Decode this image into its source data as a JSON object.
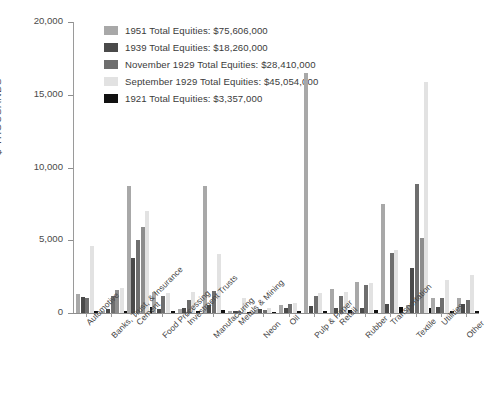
{
  "chart_data": {
    "type": "bar",
    "title": "",
    "xlabel": "",
    "ylabel": "$ THOUSANDS",
    "ylim": [
      0,
      20000
    ],
    "ytick_labels": [
      "0",
      "5,000",
      "10,000",
      "15,000",
      "20,000"
    ],
    "ytick_values": [
      0,
      5000,
      10000,
      15000,
      20000
    ],
    "grid": false,
    "legend_position": "top-left",
    "categories": [
      "Automotive",
      "Banks, Trust, & Insurance",
      "Cement",
      "Food Processing",
      "Investment Trusts",
      "Manufacturing",
      "Metals & Mining",
      "Neon",
      "Oil",
      "Pulp & Paper",
      "Retail",
      "Rubber",
      "Transportation",
      "Textile",
      "Utilities",
      "Other"
    ],
    "series": [
      {
        "name": "1951 Total Equities: $75,606,000",
        "short_name": "1951",
        "color": "#a8a8a8",
        "values": [
          1300,
          140,
          8700,
          1450,
          250,
          8700,
          170,
          240,
          560,
          16500,
          1650,
          2100,
          7500,
          530,
          1050,
          1050
        ]
      },
      {
        "name": "1939 Total Equities: $18,260,000",
        "short_name": "1939",
        "color": "#4a4a4a",
        "values": [
          1100,
          250,
          3800,
          300,
          330,
          520,
          120,
          300,
          330,
          470,
          330,
          370,
          640,
          3100,
          420,
          600
        ]
      },
      {
        "name": "November 1929 Total Equities: $28,410,000",
        "short_name": "November 1929",
        "color": "#6e6e6e",
        "values": [
          1000,
          1150,
          5000,
          1200,
          900,
          1500,
          130,
          200,
          600,
          1200,
          1200,
          1900,
          4100,
          8900,
          1050,
          900
        ]
      },
      {
        "name": "September 1929 Total Equities: $45,054,000",
        "short_name": "September 1929",
        "color": "#e2e2e2",
        "values": [
          4600,
          1700,
          7000,
          1400,
          1450,
          4050,
          1000,
          320,
          700,
          1400,
          1450,
          2050,
          4300,
          15900,
          2250,
          2600
        ]
      },
      {
        "name": "1921 Total Equities: $3,357,000",
        "short_name": "1921",
        "color": "#111111",
        "values": [
          120,
          110,
          380,
          140,
          130,
          180,
          60,
          90,
          120,
          150,
          180,
          200,
          430,
          330,
          150,
          170
        ]
      }
    ],
    "extra_series_note": {
      "name": "November 1929 secondary",
      "color": "#8d8d8d",
      "values": [
        0,
        1550,
        5900,
        0,
        0,
        0,
        0,
        0,
        0,
        0,
        0,
        0,
        0,
        5150,
        0,
        0
      ]
    }
  }
}
